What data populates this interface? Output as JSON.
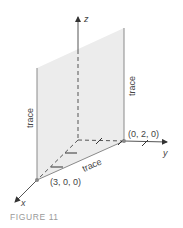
{
  "figure": {
    "caption": "FIGURE 11",
    "axes": {
      "x_label": "x",
      "y_label": "y",
      "z_label": "z"
    },
    "points": {
      "x_intercept": "(3, 0, 0)",
      "y_intercept": "(0, 2, 0)"
    },
    "trace_labels": {
      "left": "trace",
      "right": "trace",
      "bottom": "trace"
    },
    "colors": {
      "plane_fill": "#ececec",
      "axis": "#333333",
      "edge": "#8a8a8a",
      "caption": "#9a9a9a"
    }
  }
}
